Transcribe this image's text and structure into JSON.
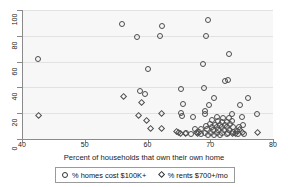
{
  "chart_data": {
    "type": "scatter",
    "title": "",
    "xlabel": "Percent of households that own their own home",
    "ylabel": "",
    "xlim": [
      40,
      80
    ],
    "ylim": [
      0,
      100
    ],
    "xticks": [
      40,
      50,
      60,
      70,
      80
    ],
    "yticks": [
      0,
      20,
      40,
      60,
      80,
      100
    ],
    "grid": "horizontal",
    "legend_position": "below-axis",
    "series": [
      {
        "name": "% homes cost $100K+",
        "marker": "circle",
        "points": [
          [
            42.6,
            62
          ],
          [
            55.9,
            89
          ],
          [
            58.4,
            79
          ],
          [
            62.0,
            80
          ],
          [
            62.3,
            87.5
          ],
          [
            69.6,
            92
          ],
          [
            69.3,
            79.5
          ],
          [
            73.0,
            66
          ],
          [
            68.9,
            58.5
          ],
          [
            60.0,
            54.5
          ],
          [
            72.4,
            45
          ],
          [
            72.8,
            45.5
          ],
          [
            65.3,
            39
          ],
          [
            69.0,
            39.5
          ],
          [
            58.8,
            37
          ],
          [
            59.6,
            35
          ],
          [
            70.6,
            31.5
          ],
          [
            76.0,
            32
          ],
          [
            65.6,
            27.5
          ],
          [
            69.8,
            26
          ],
          [
            74.8,
            26
          ],
          [
            69.1,
            22
          ],
          [
            69.1,
            19
          ],
          [
            65.4,
            20.5
          ],
          [
            65.5,
            18
          ],
          [
            73.5,
            19
          ],
          [
            77.4,
            19
          ],
          [
            75.0,
            17
          ],
          [
            71.0,
            17
          ],
          [
            72.0,
            16
          ],
          [
            73.0,
            16
          ],
          [
            70.2,
            14.5
          ],
          [
            71.2,
            14
          ],
          [
            71.9,
            13
          ],
          [
            72.6,
            13
          ],
          [
            73.4,
            14
          ],
          [
            70.0,
            12
          ],
          [
            70.8,
            11
          ],
          [
            71.6,
            11
          ],
          [
            72.4,
            11
          ],
          [
            73.1,
            11.5
          ],
          [
            69.4,
            10
          ],
          [
            70.3,
            9.5
          ],
          [
            71.1,
            9
          ],
          [
            71.9,
            9
          ],
          [
            72.7,
            9
          ],
          [
            73.6,
            9.5
          ],
          [
            68.6,
            8
          ],
          [
            69.5,
            7.5
          ],
          [
            70.4,
            7
          ],
          [
            71.3,
            7
          ],
          [
            72.2,
            7
          ],
          [
            73.0,
            7
          ],
          [
            68.2,
            5.5
          ],
          [
            69.2,
            5
          ],
          [
            70.1,
            4.5
          ],
          [
            71.0,
            4.5
          ],
          [
            71.9,
            4.5
          ],
          [
            72.8,
            5
          ],
          [
            73.7,
            5.5
          ],
          [
            68.6,
            3.5
          ],
          [
            69.6,
            3
          ],
          [
            70.6,
            3
          ],
          [
            71.6,
            3
          ],
          [
            72.6,
            3.5
          ],
          [
            74.2,
            6
          ],
          [
            74.6,
            9
          ],
          [
            75.2,
            11
          ],
          [
            67.2,
            17
          ],
          [
            67.6,
            8
          ],
          [
            66.2,
            5
          ],
          [
            67.0,
            4
          ],
          [
            74.4,
            3.5
          ],
          [
            75.4,
            4
          ]
        ]
      },
      {
        "name": "% rents $700+/mo",
        "marker": "diamond",
        "points": [
          [
            42.6,
            18
          ],
          [
            56.2,
            33
          ],
          [
            59.0,
            28
          ],
          [
            58.6,
            18
          ],
          [
            62.3,
            20
          ],
          [
            59.8,
            14
          ],
          [
            62.2,
            8
          ],
          [
            64.6,
            6
          ],
          [
            65.0,
            5
          ],
          [
            65.2,
            4.5
          ],
          [
            67.8,
            5
          ],
          [
            68.0,
            4.5
          ],
          [
            74.6,
            7
          ],
          [
            75.2,
            5
          ],
          [
            77.5,
            5
          ],
          [
            74.0,
            4
          ],
          [
            73.5,
            4
          ],
          [
            66.0,
            4
          ],
          [
            60.5,
            8
          ]
        ]
      }
    ]
  },
  "legend": {
    "entries": [
      {
        "label": "% homes cost $100K+",
        "marker": "circle-outline-icon"
      },
      {
        "label": "% rents $700+/mo",
        "marker": "diamond-outline-icon"
      }
    ]
  }
}
